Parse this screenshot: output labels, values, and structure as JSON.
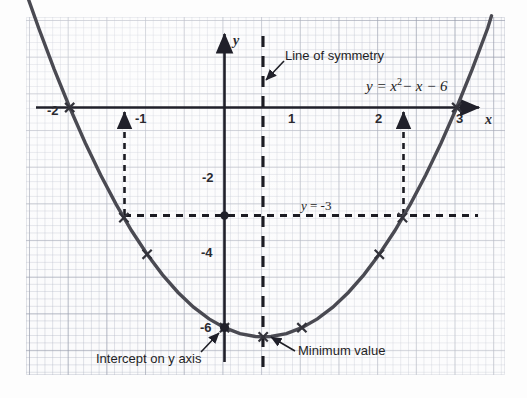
{
  "chart_data": {
    "type": "line",
    "title": "",
    "equation": "y = x²− x − 6",
    "equation_base": "y = x",
    "equation_exp": "2",
    "equation_tail": "− x − 6",
    "xlabel": "x",
    "ylabel": "y",
    "xlim": [
      -2.55,
      3.45
    ],
    "ylim": [
      -7.05,
      2.45
    ],
    "x_ticks": [
      {
        "value": -2,
        "label": "-2"
      },
      {
        "value": -1,
        "label": "-1"
      },
      {
        "value": 1,
        "label": "1"
      },
      {
        "value": 2,
        "label": "2"
      },
      {
        "value": 3,
        "label": "3"
      }
    ],
    "y_ticks": [
      {
        "value": -2,
        "label": "-2"
      },
      {
        "value": -4,
        "label": "-4"
      },
      {
        "value": -6,
        "label": "-6"
      }
    ],
    "grid": true,
    "legend": "none",
    "series": [
      {
        "name": "y = x^2 - x - 6",
        "color": "#4a4a52",
        "x": [
          -2.55,
          -2.4,
          -2.2,
          -2,
          -1.8,
          -1.6,
          -1.4,
          -1.2,
          -1,
          -0.8,
          -0.6,
          -0.4,
          -0.2,
          0,
          0.2,
          0.4,
          0.5,
          0.6,
          0.8,
          1,
          1.2,
          1.4,
          1.6,
          1.8,
          2,
          2.2,
          2.4,
          2.6,
          2.8,
          3,
          3.2,
          3.4,
          3.45
        ],
        "y": [
          3.05,
          2.16,
          1.04,
          0,
          -0.96,
          -1.84,
          -2.64,
          -3.36,
          -4,
          -4.56,
          -5.04,
          -5.44,
          -5.76,
          -6,
          -6.16,
          -6.24,
          -6.25,
          -6.24,
          -6.16,
          -6,
          -5.76,
          -5.44,
          -5.04,
          -4.56,
          -4,
          -3.36,
          -2.64,
          -1.84,
          -0.96,
          0,
          1.04,
          2.16,
          2.5
        ]
      }
    ],
    "marked_points": [
      {
        "x": -2,
        "y": 0,
        "marker": "cross"
      },
      {
        "x": -1.3,
        "y": -3,
        "marker": "cross"
      },
      {
        "x": -1,
        "y": -4,
        "marker": "cross"
      },
      {
        "x": 0,
        "y": -6,
        "marker": "cross"
      },
      {
        "x": 0.5,
        "y": -6.25,
        "marker": "cross"
      },
      {
        "x": 1,
        "y": -6,
        "marker": "cross"
      },
      {
        "x": 2,
        "y": -4,
        "marker": "cross"
      },
      {
        "x": 2.3,
        "y": -3,
        "marker": "cross"
      },
      {
        "x": 3,
        "y": 0,
        "marker": "cross"
      }
    ],
    "dot_points": [
      {
        "x": 0,
        "y": -3
      },
      {
        "x": 0,
        "y": -6
      }
    ],
    "line_of_symmetry": {
      "x": 0.5,
      "style": "dashed"
    },
    "horizontal_level": {
      "y": -3,
      "label": "y = -3",
      "label_y": "-3",
      "style": "dotted",
      "x_from": -1.3,
      "x_to": 2.3
    },
    "solution_arrows": [
      {
        "x": -1.3,
        "from_y": -3,
        "to_y": 0
      },
      {
        "x": 2.3,
        "from_y": -3,
        "to_y": 0
      }
    ],
    "annotations": [
      {
        "id": "line-of-symmetry",
        "text": "Line of symmetry",
        "anchor_x": 0.5,
        "anchor_y": 1.85
      },
      {
        "id": "y-intercept",
        "text": "Intercept on y axis",
        "anchor_x": 0,
        "anchor_y": -6
      },
      {
        "id": "minimum-value",
        "text": "Minimum value",
        "anchor_x": 0.5,
        "anchor_y": -6.25
      }
    ]
  },
  "labels": {
    "line_of_symmetry": "Line of symmetry",
    "intercept_on_y_axis": "Intercept on y axis",
    "minimum_value": "Minimum value",
    "y_level": "y = -3",
    "y_level_lhs": "y",
    "y_level_rhs": "= -3",
    "axis_x": "x",
    "axis_y": "y",
    "tick_m2": "-2",
    "tick_m1": "-1",
    "tick_1": "1",
    "tick_2": "2",
    "tick_3": "3",
    "tick_ym2": "-2",
    "tick_ym4": "-4",
    "tick_ym6": "-6",
    "eq_lhs": "y = x",
    "eq_sup": "2",
    "eq_rhs": "− x − 6"
  },
  "colors": {
    "curve": "#4a4a52",
    "axis": "#20202a",
    "grid_major": "#969baa",
    "grid_minor": "#afb4c3",
    "ink": "#1f1f26",
    "paper": "#fbfbfc"
  }
}
